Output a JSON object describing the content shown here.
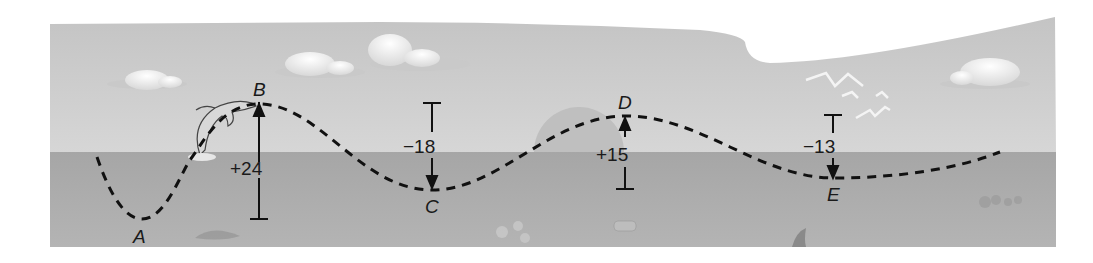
{
  "diagram": {
    "colors": {
      "sky": "#cfcfcf",
      "water": "#a9a9a9",
      "path": "#111111",
      "cloud": "#f2f2f2",
      "sun": "#b9b9b9"
    },
    "points": [
      {
        "label": "A",
        "x": 142,
        "y": 219
      },
      {
        "label": "B",
        "x": 259,
        "y": 104
      },
      {
        "label": "C",
        "x": 432,
        "y": 190
      },
      {
        "label": "D",
        "x": 626,
        "y": 116
      },
      {
        "label": "E",
        "x": 834,
        "y": 178
      }
    ],
    "changes": [
      {
        "from": "A",
        "to": "B",
        "value": "+24",
        "direction": "up"
      },
      {
        "from": "B",
        "to": "C",
        "value": "−18",
        "direction": "down"
      },
      {
        "from": "C",
        "to": "D",
        "value": "+15",
        "direction": "up"
      },
      {
        "from": "D",
        "to": "E",
        "value": "−13",
        "direction": "down"
      }
    ],
    "decorations": [
      "cloud",
      "cloud",
      "cloud",
      "cloud",
      "dolphin",
      "sun",
      "birds",
      "fish",
      "coral",
      "rock",
      "fin"
    ]
  }
}
